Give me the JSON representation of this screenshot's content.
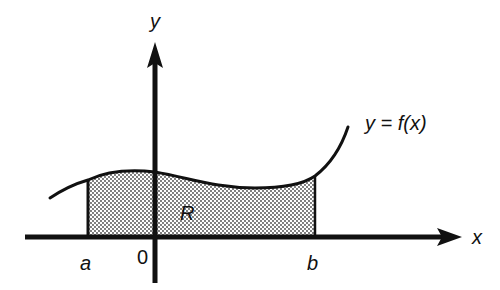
{
  "diagram": {
    "labels": {
      "y_axis": "y",
      "x_axis": "x",
      "curve": "y = f(x)",
      "region": "R",
      "a": "a",
      "origin": "0",
      "b": "b"
    },
    "colors": {
      "ink": "#111111",
      "background": "#ffffff",
      "dots": "#444444"
    }
  }
}
